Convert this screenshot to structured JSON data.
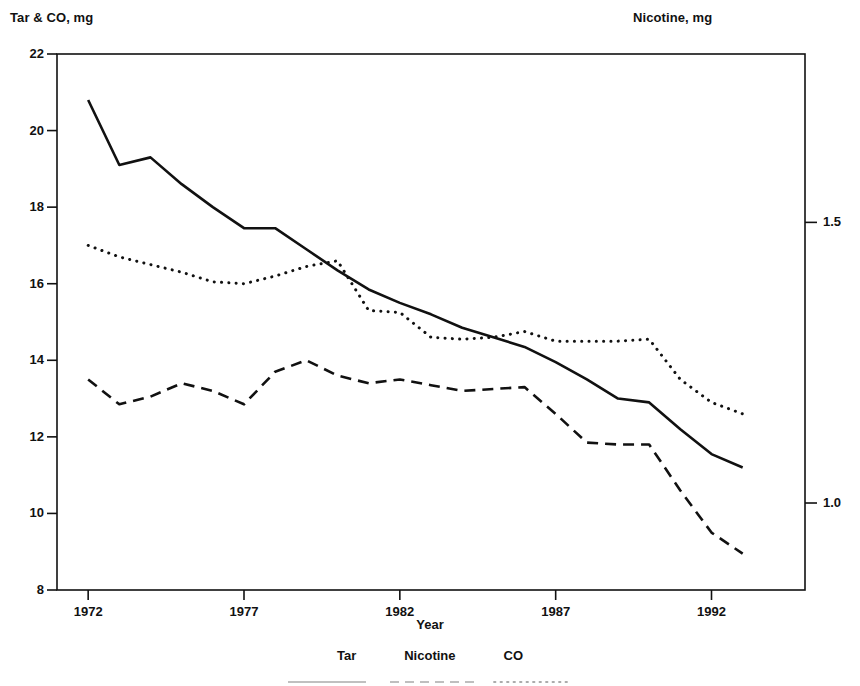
{
  "chart_data": {
    "type": "line",
    "title": "",
    "xlabel": "Year",
    "ylabel": "Tar & CO, mg",
    "y2label": "Nicotine, mg",
    "xlim": [
      1971,
      1995
    ],
    "ylim": [
      8,
      22
    ],
    "y2lim": [
      0.845,
      1.8
    ],
    "grid": false,
    "legend_position": "bottom-center",
    "xticks": [
      1972,
      1977,
      1982,
      1987,
      1992
    ],
    "xtick_labels": [
      "1972",
      "1977",
      "1982",
      "1987",
      "1992"
    ],
    "yticks": [
      8,
      10,
      12,
      14,
      16,
      18,
      20,
      22
    ],
    "ytick_labels": [
      "8",
      "10",
      "12",
      "14",
      "16",
      "18",
      "20",
      "22"
    ],
    "y2ticks": [
      1.0,
      1.5,
      2.0
    ],
    "y2tick_labels": [
      "1.0",
      "1.5",
      "2.0"
    ],
    "x": [
      1972,
      1973,
      1974,
      1975,
      1976,
      1977,
      1978,
      1979,
      1980,
      1981,
      1982,
      1983,
      1984,
      1985,
      1986,
      1987,
      1988,
      1989,
      1990,
      1991,
      1992,
      1993
    ],
    "series": [
      {
        "name": "Tar",
        "axis": "left",
        "style": "solid",
        "units": "mg",
        "values": [
          20.8,
          19.1,
          19.3,
          18.6,
          18.0,
          17.45,
          17.45,
          16.9,
          16.35,
          15.85,
          15.5,
          15.2,
          14.85,
          14.6,
          14.35,
          13.95,
          13.5,
          13.0,
          12.9,
          12.2,
          11.55,
          11.2
        ]
      },
      {
        "name": "CO",
        "axis": "left",
        "style": "dotted",
        "units": "mg",
        "values": [
          17.0,
          16.7,
          16.5,
          16.3,
          16.05,
          16.0,
          16.2,
          16.45,
          16.6,
          15.3,
          15.25,
          14.6,
          14.55,
          14.6,
          14.75,
          14.5,
          14.5,
          14.5,
          14.55,
          13.5,
          12.9,
          12.6
        ]
      },
      {
        "name": "Nicotine",
        "axis": "right",
        "style": "dashed",
        "units": "mg",
        "values_left_scale": [
          13.5,
          12.85,
          13.05,
          13.4,
          13.2,
          12.85,
          13.7,
          14.0,
          13.6,
          13.4,
          13.5,
          13.35,
          13.2,
          13.25,
          13.3,
          12.6,
          11.85,
          11.8,
          11.8,
          10.6,
          9.5,
          8.95
        ],
        "values": [
          1.24,
          1.18,
          1.2,
          1.23,
          1.21,
          1.18,
          1.27,
          1.29,
          1.25,
          1.24,
          1.24,
          1.23,
          1.22,
          1.22,
          1.23,
          1.16,
          1.09,
          1.09,
          1.09,
          0.97,
          0.86,
          0.81
        ]
      }
    ]
  },
  "axes": {
    "left_title": "Tar & CO, mg",
    "right_title": "Nicotine, mg",
    "x_title": "Year"
  },
  "legend": {
    "items": [
      {
        "label": "Tar",
        "style": "solid"
      },
      {
        "label": "Nicotine",
        "style": "dashed"
      },
      {
        "label": "CO",
        "style": "dotted"
      }
    ]
  },
  "colors": {
    "line": "#111111",
    "axis": "#111111",
    "background": "#ffffff"
  }
}
